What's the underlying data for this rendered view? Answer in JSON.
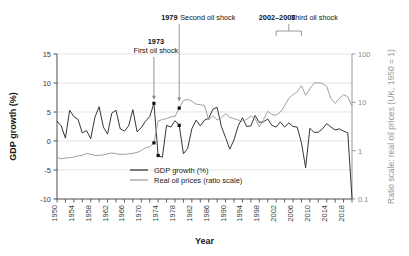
{
  "chart_data": {
    "type": "line",
    "title": "",
    "xlabel": "Year",
    "ylabel": "GDP growth (%)",
    "ylabel_right": "Ratio scale: real oil prices (UK, 1950 = 1)",
    "xlim": [
      1950,
      2020
    ],
    "ylim": [
      -10,
      15
    ],
    "ylim_right": [
      0.1,
      100
    ],
    "right_axis_scale": "log",
    "grid": true,
    "legend_position": "bottom-center",
    "yticks": [
      -10,
      -5,
      0,
      5,
      10,
      15
    ],
    "ytick_labels": [
      "-10",
      "-5",
      "0",
      "5",
      "10",
      "15"
    ],
    "yticks_right": [
      0.1,
      1,
      10,
      100
    ],
    "ytick_labels_right": [
      "0.1",
      "1",
      "10",
      "100"
    ],
    "xticks": [
      1950,
      1954,
      1958,
      1962,
      1966,
      1970,
      1974,
      1978,
      1982,
      1986,
      1990,
      1994,
      1998,
      2002,
      2006,
      2010,
      2014,
      2018
    ],
    "xtick_labels": [
      "1950",
      "1954",
      "1958",
      "1962",
      "1966",
      "1970",
      "1974",
      "1978",
      "1982",
      "1986",
      "1990",
      "1994",
      "1998",
      "2002",
      "2006",
      "2010",
      "2014",
      "2018"
    ],
    "xtick_minor_step": 2,
    "series": [
      {
        "name": "GDP growth (%)",
        "color": "#2b2b2b",
        "axis": "left",
        "x": [
          1950,
          1951,
          1952,
          1953,
          1954,
          1955,
          1956,
          1957,
          1958,
          1959,
          1960,
          1961,
          1962,
          1963,
          1964,
          1965,
          1966,
          1967,
          1968,
          1969,
          1970,
          1971,
          1972,
          1973,
          1974,
          1975,
          1976,
          1977,
          1978,
          1979,
          1980,
          1981,
          1982,
          1983,
          1984,
          1985,
          1986,
          1987,
          1988,
          1989,
          1990,
          1991,
          1992,
          1993,
          1994,
          1995,
          1996,
          1997,
          1998,
          1999,
          2000,
          2001,
          2002,
          2003,
          2004,
          2005,
          2006,
          2007,
          2008,
          2009,
          2010,
          2011,
          2012,
          2013,
          2014,
          2015,
          2016,
          2017,
          2018,
          2019,
          2020
        ],
        "values": [
          3.4,
          2.6,
          0.5,
          5.3,
          4.2,
          3.7,
          1.4,
          1.8,
          0.4,
          4.1,
          5.9,
          2.4,
          1.2,
          4.8,
          5.3,
          2.1,
          1.7,
          2.6,
          5.4,
          1.6,
          2.3,
          3.4,
          4.2,
          6.5,
          -2.5,
          -2.8,
          2.7,
          2.4,
          3.5,
          2.7,
          -2.2,
          -1.3,
          2.1,
          3.6,
          2.6,
          3.6,
          3.9,
          5.5,
          5.8,
          2.5,
          0.6,
          -1.4,
          0.2,
          2.6,
          4.0,
          2.5,
          2.6,
          4.4,
          3.2,
          3.3,
          3.8,
          2.7,
          2.4,
          3.3,
          2.4,
          3.1,
          2.5,
          2.4,
          -0.3,
          -4.6,
          2.2,
          1.5,
          1.5,
          2.1,
          3.0,
          2.4,
          1.9,
          2.1,
          1.7,
          1.4,
          -9.9
        ]
      },
      {
        "name": "Real oil prices (ratio scale)",
        "color": "#9a9a9a",
        "axis": "right",
        "x": [
          1950,
          1951,
          1952,
          1953,
          1954,
          1955,
          1956,
          1957,
          1958,
          1959,
          1960,
          1961,
          1962,
          1963,
          1964,
          1965,
          1966,
          1967,
          1968,
          1969,
          1970,
          1971,
          1972,
          1973,
          1974,
          1975,
          1976,
          1977,
          1978,
          1979,
          1980,
          1981,
          1982,
          1983,
          1984,
          1985,
          1986,
          1987,
          1988,
          1989,
          1990,
          1991,
          1992,
          1993,
          1994,
          1995,
          1996,
          1997,
          1998,
          1999,
          2000,
          2001,
          2002,
          2003,
          2004,
          2005,
          2006,
          2007,
          2008,
          2009,
          2010,
          2011,
          2012,
          2013,
          2014,
          2015,
          2016,
          2017,
          2018,
          2019,
          2020
        ],
        "values": [
          0.72,
          0.68,
          0.7,
          0.72,
          0.74,
          0.78,
          0.8,
          0.88,
          0.84,
          0.8,
          0.8,
          0.82,
          0.86,
          0.9,
          0.86,
          0.84,
          0.84,
          0.86,
          0.88,
          0.92,
          1.0,
          1.15,
          1.2,
          1.45,
          4.1,
          4.4,
          4.6,
          5.0,
          5.1,
          7.6,
          11.0,
          11.5,
          10.5,
          9.2,
          8.9,
          8.6,
          4.3,
          5.3,
          4.3,
          4.8,
          5.8,
          4.9,
          4.6,
          4.3,
          4.1,
          4.4,
          5.2,
          4.7,
          3.1,
          4.4,
          6.5,
          5.6,
          5.4,
          6.3,
          8.4,
          12.0,
          14.5,
          16.5,
          22.0,
          14.0,
          19.0,
          25.0,
          25.5,
          24.5,
          21.5,
          12.0,
          9.5,
          12.0,
          14.5,
          13.0,
          8.5
        ]
      }
    ],
    "annotations": [
      {
        "id": "first-oil-shock",
        "year_label": "1973",
        "text": "First oil shock",
        "x": 1973,
        "bold": "1973"
      },
      {
        "id": "second-oil-shock",
        "year_label": "1979",
        "text": "Second oil shock",
        "x": 1979,
        "bold": "1979"
      },
      {
        "id": "third-oil-shock",
        "year_label": "2002–2008",
        "text": "Third oil shock",
        "x_start": 2002,
        "x_end": 2008,
        "bold": "2002–2008"
      }
    ],
    "markers": [
      {
        "series": "gdp",
        "x": 1973,
        "y": 6.5
      },
      {
        "series": "gdp",
        "x": 1974,
        "y": -2.5
      },
      {
        "series": "gdp",
        "x": 1979,
        "y": 2.7
      },
      {
        "series": "oil",
        "x": 1973,
        "y": 1.45
      },
      {
        "series": "oil",
        "x": 1979,
        "y": 7.6
      }
    ]
  },
  "legend": {
    "items": [
      {
        "label": "GDP growth (%)",
        "color": "#2b2b2b"
      },
      {
        "label": "Real oil prices (ratio scale)",
        "color": "#9a9a9a"
      }
    ]
  },
  "axes": {
    "left_title": "GDP growth (%)",
    "bottom_title": "Year",
    "right_title": "Ratio scale: real oil prices (UK, 1950 = 1)"
  },
  "annotations_text": {
    "first_bold": "1973",
    "first_rest": "First oil shock",
    "second_bold": "1979",
    "second_rest": "Second oil shock",
    "third_bold": "2002–2008",
    "third_rest": "Third oil shock"
  },
  "colors": {
    "gdp_line": "#2b2b2b",
    "oil_line": "#9a9a9a",
    "grid": "#d9d9d9",
    "axis": "#4d4d4d",
    "right_axis": "#9a9a9a",
    "background": "#ffffff"
  }
}
